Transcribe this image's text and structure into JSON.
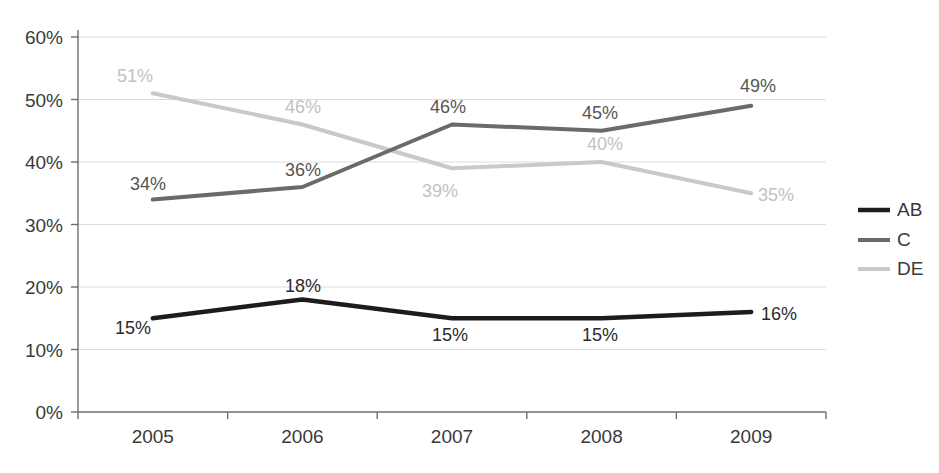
{
  "chart_data": {
    "type": "line",
    "title": "",
    "subtitle": "",
    "xlabel": "",
    "ylabel": "",
    "categories": [
      "2005",
      "2006",
      "2007",
      "2008",
      "2009"
    ],
    "series": [
      {
        "name": "AB",
        "color": "#1c1c1c",
        "values": [
          15,
          18,
          15,
          15,
          16
        ],
        "labels": [
          "15%",
          "18%",
          "15%",
          "15%",
          "16%"
        ]
      },
      {
        "name": "C",
        "color": "#6a6a6a",
        "values": [
          34,
          36,
          46,
          45,
          49
        ],
        "labels": [
          "34%",
          "36%",
          "46%",
          "45%",
          "49%"
        ]
      },
      {
        "name": "DE",
        "color": "#c9c9c9",
        "values": [
          51,
          46,
          39,
          40,
          35
        ],
        "labels": [
          "51%",
          "46%",
          "39%",
          "40%",
          "35%"
        ]
      }
    ],
    "ylim": [
      0,
      60
    ],
    "ytick_values": [
      0,
      10,
      20,
      30,
      40,
      50,
      60
    ],
    "ytick_labels": [
      "0%",
      "10%",
      "20%",
      "30%",
      "40%",
      "50%",
      "60%"
    ],
    "xtick_labels": [
      "2005",
      "2006",
      "2007",
      "2008",
      "2009"
    ],
    "grid": true,
    "grid_color": "#dcdcdc",
    "axis_color": "#6e6e6e",
    "legend_position": "right",
    "legend_entries": [
      {
        "label": "AB",
        "color": "#1c1c1c"
      },
      {
        "label": "C",
        "color": "#6a6a6a"
      },
      {
        "label": "DE",
        "color": "#c9c9c9"
      }
    ]
  },
  "axis": {
    "y_labels": [
      "60%",
      "50%",
      "40%",
      "30%",
      "20%",
      "10%",
      "0%"
    ],
    "x_labels": [
      "2005",
      "2006",
      "2007",
      "2008",
      "2009"
    ]
  },
  "data_labels": {
    "ab": [
      "15%",
      "18%",
      "15%",
      "15%",
      "16%"
    ],
    "c": [
      "34%",
      "36%",
      "46%",
      "45%",
      "49%"
    ],
    "de": [
      "51%",
      "46%",
      "39%",
      "40%",
      "35%"
    ]
  },
  "legend": {
    "items": [
      {
        "label": "AB"
      },
      {
        "label": "C"
      },
      {
        "label": "DE"
      }
    ]
  }
}
